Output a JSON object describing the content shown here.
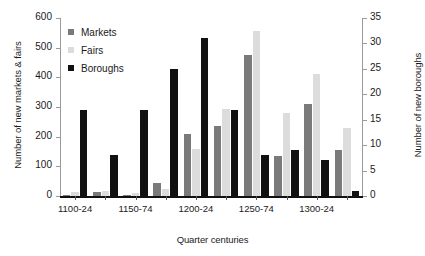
{
  "chart_data": {
    "type": "bar",
    "title": "",
    "xlabel": "Quarter centuries",
    "ylabel": "Number of new markets & fairs",
    "ylabel_right": "Number of new boroughs",
    "grid": false,
    "legend_position": "top-left",
    "ylim": [
      0,
      600
    ],
    "ylim_right": [
      0,
      35
    ],
    "yticks": [
      0,
      100,
      200,
      300,
      400,
      500,
      600
    ],
    "yticks_right": [
      0,
      5,
      10,
      15,
      20,
      25,
      30,
      35
    ],
    "categories": [
      "1100-24",
      "1125-49",
      "1150-74",
      "1175-99",
      "1200-24",
      "1225-49",
      "1250-74",
      "1275-99",
      "1300-24",
      "1325-49"
    ],
    "xtick_labels_shown": [
      "1100-24",
      "1150-74",
      "1200-24",
      "1250-74",
      "1300-24"
    ],
    "series": [
      {
        "name": "Markets",
        "axis": "left",
        "color": "#7a7a7a",
        "values": [
          5,
          12,
          5,
          45,
          210,
          235,
          475,
          135,
          310,
          155
        ]
      },
      {
        "name": "Fairs",
        "axis": "left",
        "color": "#dcdcdc",
        "values": [
          14,
          17,
          11,
          22,
          160,
          293,
          555,
          280,
          410,
          230
        ]
      },
      {
        "name": "Boroughs",
        "axis": "right",
        "color": "#111111",
        "values": [
          17,
          8,
          17,
          25,
          31,
          17,
          8,
          9,
          7,
          1
        ]
      }
    ]
  },
  "legend": {
    "items": [
      {
        "label": "Markets",
        "key": "markets"
      },
      {
        "label": "Fairs",
        "key": "fairs"
      },
      {
        "label": "Boroughs",
        "key": "boroughs"
      }
    ]
  },
  "colors": {
    "markets": "#7a7a7a",
    "fairs": "#dcdcdc",
    "boroughs": "#111111",
    "axis": "#9a9a9a",
    "text": "#1a1a1a",
    "background": "#ffffff"
  }
}
